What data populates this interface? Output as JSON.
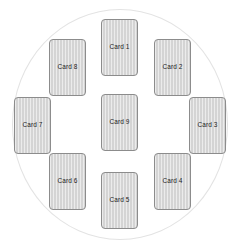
{
  "layout": {
    "shape_name": "circle-arrangement",
    "card_count": 9,
    "background_color": "#ffffff",
    "circle_stroke_color": "#e3e3e3",
    "card_fill_color": "#d4d4d4",
    "card_border_color": "#8c8c8c",
    "card_label_color": "#1d1d1d"
  },
  "cards": [
    {
      "id": "card-1",
      "label": "Card 1",
      "position": "top"
    },
    {
      "id": "card-2",
      "label": "Card 2",
      "position": "top-right"
    },
    {
      "id": "card-3",
      "label": "Card 3",
      "position": "right"
    },
    {
      "id": "card-4",
      "label": "Card 4",
      "position": "bottom-right"
    },
    {
      "id": "card-5",
      "label": "Card 5",
      "position": "bottom"
    },
    {
      "id": "card-6",
      "label": "Card 6",
      "position": "bottom-left"
    },
    {
      "id": "card-7",
      "label": "Card 7",
      "position": "left"
    },
    {
      "id": "card-8",
      "label": "Card 8",
      "position": "top-left"
    },
    {
      "id": "card-9",
      "label": "Card 9",
      "position": "center"
    }
  ]
}
